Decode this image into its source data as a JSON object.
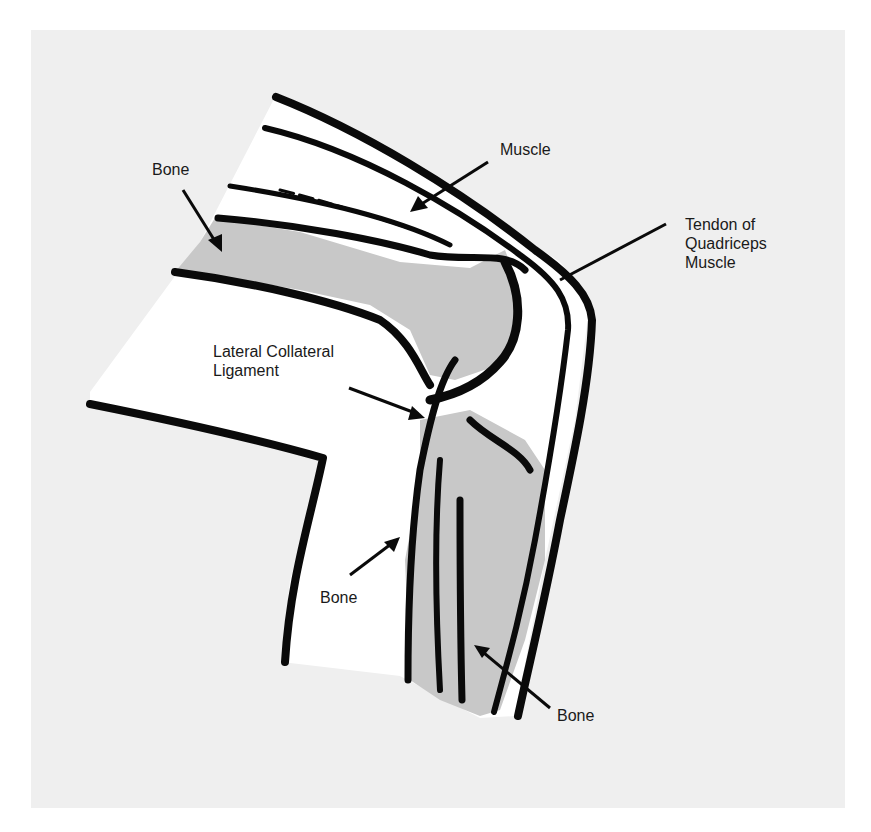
{
  "figure": {
    "colors": {
      "background": "#ffffff",
      "panel": "#efefef",
      "soft_tissue": "#ffffff",
      "bone": "#c8c8c8",
      "outline": "#0a0a0a",
      "text": "#1a1a1a"
    }
  },
  "labels": {
    "bone_thigh": {
      "lines": [
        "Bone"
      ]
    },
    "muscle": {
      "lines": [
        "Muscle"
      ]
    },
    "tendon": {
      "lines": [
        "Tendon of",
        "Quadriceps",
        "Muscle"
      ]
    },
    "ligament": {
      "lines": [
        "Lateral Collateral",
        "Ligament"
      ]
    },
    "bone_fibula": {
      "lines": [
        "Bone"
      ]
    },
    "bone_tibia": {
      "lines": [
        "Bone"
      ]
    }
  }
}
